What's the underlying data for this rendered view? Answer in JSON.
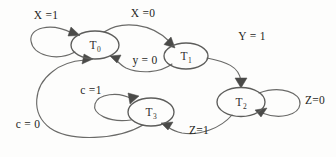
{
  "diagram": {
    "kind": "state-transition-diagram",
    "canvas": {
      "width": 336,
      "height": 157
    },
    "stroke_color": "#6a6a68",
    "text_color": "#1f1f1d",
    "background_color": "#fdfdfc",
    "states": [
      {
        "id": "T0",
        "name": "T",
        "subscript": "0",
        "cx": 95,
        "cy": 45,
        "rx": 24,
        "ry": 14
      },
      {
        "id": "T1",
        "name": "T",
        "subscript": "1",
        "cx": 186,
        "cy": 56,
        "rx": 22,
        "ry": 13
      },
      {
        "id": "T2",
        "name": "T",
        "subscript": "2",
        "cx": 241,
        "cy": 102,
        "rx": 24,
        "ry": 14.5
      },
      {
        "id": "T3",
        "name": "T",
        "subscript": "3",
        "cx": 151,
        "cy": 112,
        "rx": 23,
        "ry": 14
      }
    ],
    "transitions": [
      {
        "id": "t0-self",
        "from": "T0",
        "to": "T0",
        "label": "X =1",
        "label_x": 46,
        "label_y": 15
      },
      {
        "id": "t0-to-t1",
        "from": "T0",
        "to": "T1",
        "label": "X =0",
        "label_x": 143,
        "label_y": 13
      },
      {
        "id": "t1-to-t0",
        "from": "T1",
        "to": "T0",
        "label": "y = 0",
        "label_x": 145,
        "label_y": 60
      },
      {
        "id": "t1-to-t2",
        "from": "T1",
        "to": "T2",
        "label": "Y = 1",
        "label_x": 252,
        "label_y": 36
      },
      {
        "id": "t2-self",
        "from": "T2",
        "to": "T2",
        "label": "Z=0",
        "label_x": 315,
        "label_y": 100
      },
      {
        "id": "t2-to-t3",
        "from": "T2",
        "to": "T3",
        "label": "Z=1",
        "label_x": 199,
        "label_y": 130
      },
      {
        "id": "t3-self",
        "from": "T3",
        "to": "T3",
        "label": "c =1",
        "label_x": 91,
        "label_y": 90
      },
      {
        "id": "t3-to-t0",
        "from": "T3",
        "to": "T0",
        "label": "c = 0",
        "label_x": 28,
        "label_y": 124
      }
    ]
  }
}
